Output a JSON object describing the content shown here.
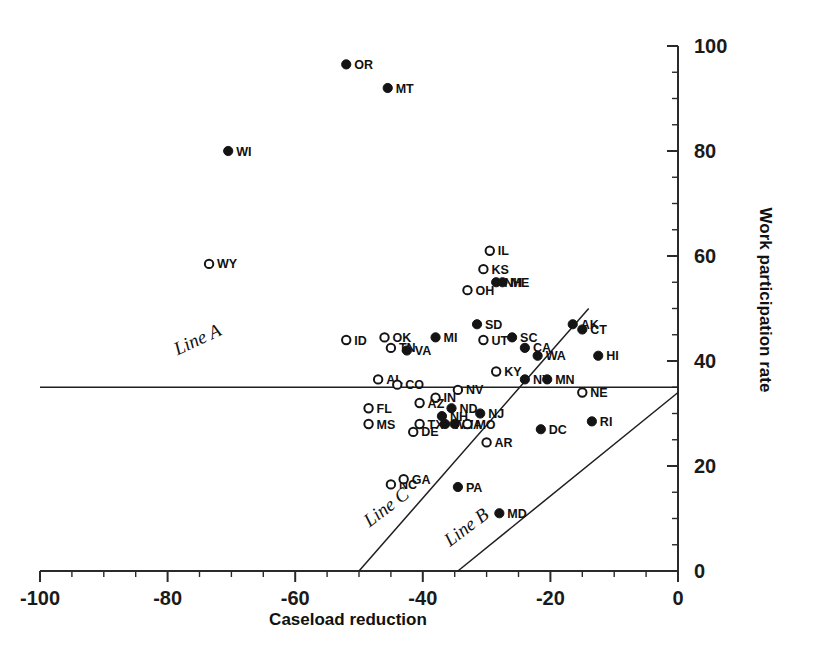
{
  "chart_data": {
    "type": "scatter",
    "title": "",
    "xlabel": "Caseload reduction",
    "ylabel": "Work participation rate",
    "xlim": [
      -100,
      0
    ],
    "ylim": [
      0,
      100
    ],
    "xticks": [
      -100,
      -80,
      -60,
      -40,
      -20,
      0
    ],
    "xtick_labels": [
      "-100",
      "-80",
      "-60",
      "-40",
      "-20",
      "0"
    ],
    "yticks": [
      0,
      20,
      40,
      60,
      80,
      100
    ],
    "ytick_labels": [
      "0",
      "20",
      "40",
      "60",
      "80",
      "100"
    ],
    "x_minor_step": 5,
    "y_minor_step": 5,
    "grid": false,
    "legend": "none",
    "marker_styles": {
      "filled": "solid black circle",
      "open": "white circle with black outline"
    },
    "points": [
      {
        "label": "OR",
        "x": -52.0,
        "y": 96.5,
        "style": "filled"
      },
      {
        "label": "MT",
        "x": -45.5,
        "y": 92.0,
        "style": "filled"
      },
      {
        "label": "WI",
        "x": -70.5,
        "y": 80.0,
        "style": "filled"
      },
      {
        "label": "WY",
        "x": -73.5,
        "y": 58.5,
        "style": "open"
      },
      {
        "label": "IL",
        "x": -29.5,
        "y": 61.0,
        "style": "open"
      },
      {
        "label": "KS",
        "x": -30.5,
        "y": 57.5,
        "style": "open"
      },
      {
        "label": "NH",
        "x": -28.5,
        "y": 55.0,
        "style": "filled"
      },
      {
        "label": "ME",
        "x": -27.5,
        "y": 55.0,
        "style": "filled"
      },
      {
        "label": "OH",
        "x": -33.0,
        "y": 53.5,
        "style": "open"
      },
      {
        "label": "SD",
        "x": -31.5,
        "y": 47.0,
        "style": "filled"
      },
      {
        "label": "AK",
        "x": -16.5,
        "y": 47.0,
        "style": "filled"
      },
      {
        "label": "CT",
        "x": -15.0,
        "y": 46.0,
        "style": "filled"
      },
      {
        "label": "MI",
        "x": -38.0,
        "y": 44.5,
        "style": "filled"
      },
      {
        "label": "UT",
        "x": -30.5,
        "y": 44.0,
        "style": "open"
      },
      {
        "label": "SC",
        "x": -26.0,
        "y": 44.5,
        "style": "filled"
      },
      {
        "label": "OK",
        "x": -46.0,
        "y": 44.5,
        "style": "open"
      },
      {
        "label": "ID",
        "x": -52.0,
        "y": 44.0,
        "style": "open"
      },
      {
        "label": "TN",
        "x": -45.0,
        "y": 42.5,
        "style": "open"
      },
      {
        "label": "VA",
        "x": -42.5,
        "y": 42.0,
        "style": "filled"
      },
      {
        "label": "CA",
        "x": -24.0,
        "y": 42.5,
        "style": "filled"
      },
      {
        "label": "WA",
        "x": -22.0,
        "y": 41.0,
        "style": "filled"
      },
      {
        "label": "HI",
        "x": -12.5,
        "y": 41.0,
        "style": "filled"
      },
      {
        "label": "KY",
        "x": -28.5,
        "y": 38.0,
        "style": "open"
      },
      {
        "label": "NY",
        "x": -24.0,
        "y": 36.5,
        "style": "filled"
      },
      {
        "label": "MN",
        "x": -20.5,
        "y": 36.5,
        "style": "filled"
      },
      {
        "label": "AL",
        "x": -47.0,
        "y": 36.5,
        "style": "open"
      },
      {
        "label": "CO",
        "x": -44.0,
        "y": 35.5,
        "style": "open"
      },
      {
        "label": "NV",
        "x": -34.5,
        "y": 34.5,
        "style": "open"
      },
      {
        "label": "NE",
        "x": -15.0,
        "y": 34.0,
        "style": "open"
      },
      {
        "label": "IN",
        "x": -38.0,
        "y": 33.0,
        "style": "open"
      },
      {
        "label": "AZ",
        "x": -40.5,
        "y": 32.0,
        "style": "open"
      },
      {
        "label": "FL",
        "x": -48.5,
        "y": 31.0,
        "style": "open"
      },
      {
        "label": "ND",
        "x": -35.5,
        "y": 31.0,
        "style": "filled"
      },
      {
        "label": "NJ",
        "x": -31.0,
        "y": 30.0,
        "style": "filled"
      },
      {
        "label": "NH2",
        "x": -37.0,
        "y": 29.5,
        "style": "filled"
      },
      {
        "label": "MS",
        "x": -48.5,
        "y": 28.0,
        "style": "open"
      },
      {
        "label": "TX",
        "x": -40.5,
        "y": 28.0,
        "style": "open"
      },
      {
        "label": "WV",
        "x": -36.5,
        "y": 28.0,
        "style": "filled"
      },
      {
        "label": "MA",
        "x": -35.0,
        "y": 28.0,
        "style": "filled"
      },
      {
        "label": "MO",
        "x": -33.0,
        "y": 28.0,
        "style": "open"
      },
      {
        "label": "DE",
        "x": -41.5,
        "y": 26.5,
        "style": "open"
      },
      {
        "label": "DC",
        "x": -21.5,
        "y": 27.0,
        "style": "filled"
      },
      {
        "label": "RI",
        "x": -13.5,
        "y": 28.5,
        "style": "filled"
      },
      {
        "label": "AR",
        "x": -30.0,
        "y": 24.5,
        "style": "open"
      },
      {
        "label": "NC",
        "x": -45.0,
        "y": 16.5,
        "style": "open"
      },
      {
        "label": "GA",
        "x": -43.0,
        "y": 17.5,
        "style": "open"
      },
      {
        "label": "PA",
        "x": -34.5,
        "y": 16.0,
        "style": "filled"
      },
      {
        "label": "MD",
        "x": -28.0,
        "y": 11.0,
        "style": "filled"
      }
    ],
    "reference_lines": [
      {
        "name": "Line A",
        "orientation": "horizontal",
        "y": 35.0,
        "x_start": -100,
        "x_end": 0,
        "label": "Line A"
      },
      {
        "name": "Line B",
        "orientation": "diagonal",
        "x_start": -34.5,
        "y_start": 0,
        "x_end": 0,
        "y_end": 34.0,
        "label": "Line B"
      },
      {
        "name": "Line C",
        "orientation": "diagonal",
        "x_start": -50.0,
        "y_start": 0,
        "x_end": -14.0,
        "y_end": 50.0,
        "label": "Line C"
      }
    ],
    "line_annotations": [
      {
        "label": "Line A",
        "x_px": 200,
        "y_px": 345,
        "rotation": -25
      },
      {
        "label": "Line C",
        "x_px": 390,
        "y_px": 512,
        "rotation": -37
      },
      {
        "label": "Line B",
        "x_px": 470,
        "y_px": 532,
        "rotation": -37
      }
    ]
  }
}
